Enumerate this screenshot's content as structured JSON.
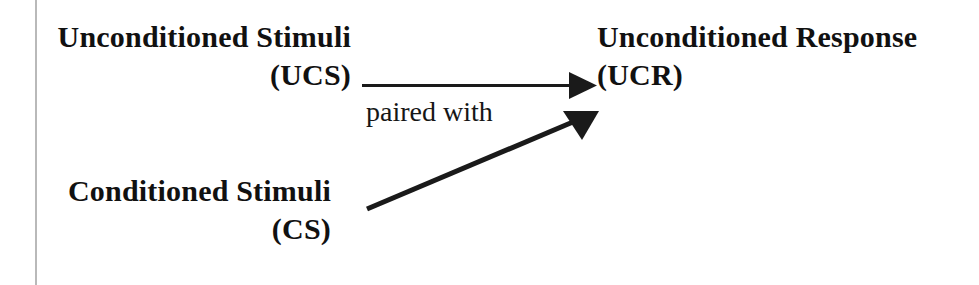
{
  "figure": {
    "type": "classical-conditioning-diagram",
    "width": 979,
    "height": 285,
    "background_color": "#ffffff",
    "ink_color": "#111111",
    "margin_rule_color": "#b9b9b9"
  },
  "nodes": {
    "unconditioned_stimuli": {
      "line1": "Unconditioned Stimuli",
      "line2": "(UCS)"
    },
    "conditioned_stimuli": {
      "line1": "Conditioned Stimuli",
      "line2": "(CS)"
    },
    "unconditioned_response": {
      "line1": "Unconditioned Response",
      "line2": "(UCR)"
    }
  },
  "connectors": {
    "ucs_to_ucr": {
      "label": "",
      "from": "unconditioned_stimuli",
      "to": "unconditioned_response",
      "x1": 362,
      "y1": 85,
      "x2": 597,
      "y2": 85
    },
    "cs_to_ucr": {
      "label": "",
      "from": "conditioned_stimuli",
      "to": "unconditioned_response",
      "x1": 367,
      "y1": 209,
      "x2": 598,
      "y2": 112
    }
  },
  "annotations": {
    "paired_with": "paired with"
  }
}
